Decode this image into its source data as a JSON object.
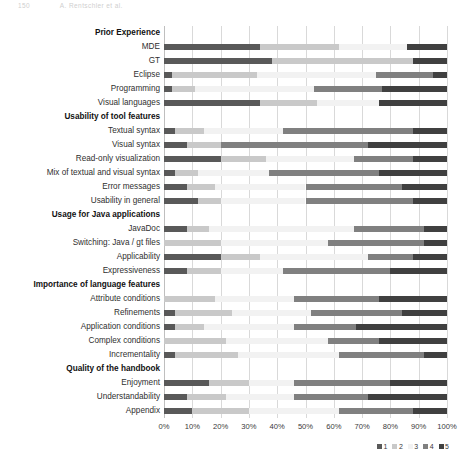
{
  "page_header": {
    "left": "150",
    "right": "A. Rentschler et al."
  },
  "chart_data": {
    "type": "bar",
    "subtype": "stacked-horizontal-100pct",
    "title": "",
    "xlabel": "",
    "ylabel": "",
    "xlim": [
      0,
      100
    ],
    "xticks": [
      "0%",
      "10%",
      "20%",
      "30%",
      "40%",
      "50%",
      "60%",
      "70%",
      "80%",
      "90%",
      "100%"
    ],
    "xtick_values": [
      0,
      10,
      20,
      30,
      40,
      50,
      60,
      70,
      80,
      90,
      100
    ],
    "grid": true,
    "grid_axis": "x",
    "legend": {
      "position": "bottom-right",
      "orientation": "horizontal",
      "entries": [
        {
          "name": "1",
          "color": "#595959"
        },
        {
          "name": "2",
          "color": "#c9c9c9"
        },
        {
          "name": "3",
          "color": "#f2f2f2"
        },
        {
          "name": "4",
          "color": "#808080"
        },
        {
          "name": "5",
          "color": "#404040"
        }
      ]
    },
    "series": [
      {
        "name": "1",
        "color": "#595959"
      },
      {
        "name": "2",
        "color": "#c9c9c9"
      },
      {
        "name": "3",
        "color": "#f2f2f2"
      },
      {
        "name": "4",
        "color": "#808080"
      },
      {
        "name": "5",
        "color": "#404040"
      }
    ],
    "groups": [
      {
        "label": "Prior Experience",
        "categories": [
          {
            "label": "MDE",
            "values": [
              34,
              28,
              24,
              0,
              14
            ]
          },
          {
            "label": "GT",
            "values": [
              38,
              50,
              0,
              0,
              12
            ]
          },
          {
            "label": "Eclipse",
            "values": [
              3,
              30,
              42,
              20,
              5
            ]
          },
          {
            "label": "Programming",
            "values": [
              3,
              8,
              42,
              24,
              23
            ]
          },
          {
            "label": "Visual languages",
            "values": [
              34,
              20,
              22,
              0,
              24
            ]
          }
        ]
      },
      {
        "label": "Usability of tool features",
        "categories": [
          {
            "label": "Textual syntax",
            "values": [
              4,
              10,
              28,
              46,
              12
            ]
          },
          {
            "label": "Visual syntax",
            "values": [
              8,
              12,
              0,
              52,
              28
            ]
          },
          {
            "label": "Read-only visualization",
            "values": [
              20,
              16,
              31,
              21,
              12
            ]
          },
          {
            "label": "Mix of textual and visual syntax",
            "values": [
              4,
              8,
              25,
              39,
              24
            ]
          },
          {
            "label": "Error messages",
            "values": [
              8,
              10,
              32,
              34,
              16
            ]
          },
          {
            "label": "Usability in general",
            "values": [
              12,
              8,
              30,
              38,
              12
            ]
          }
        ]
      },
      {
        "label": "Usage for Java applications",
        "categories": [
          {
            "label": "JavaDoc",
            "values": [
              8,
              8,
              51,
              25,
              8
            ]
          },
          {
            "label": "Switching: Java / gt files",
            "values": [
              0,
              20,
              38,
              34,
              8
            ]
          },
          {
            "label": "Applicability",
            "values": [
              20,
              14,
              38,
              16,
              12
            ]
          },
          {
            "label": "Expressiveness",
            "values": [
              8,
              12,
              22,
              38,
              20
            ]
          }
        ]
      },
      {
        "label": "Importance of language features",
        "categories": [
          {
            "label": "Attribute conditions",
            "values": [
              0,
              18,
              28,
              30,
              24
            ]
          },
          {
            "label": "Refinements",
            "values": [
              4,
              20,
              28,
              32,
              16
            ]
          },
          {
            "label": "Application conditions",
            "values": [
              4,
              10,
              32,
              22,
              32
            ]
          },
          {
            "label": "Complex conditions",
            "values": [
              0,
              22,
              36,
              18,
              24
            ]
          },
          {
            "label": "Incrementality",
            "values": [
              4,
              22,
              36,
              30,
              8
            ]
          }
        ]
      },
      {
        "label": "Quality of the handbook",
        "categories": [
          {
            "label": "Enjoyment",
            "values": [
              16,
              14,
              16,
              34,
              20
            ]
          },
          {
            "label": "Understandability",
            "values": [
              8,
              14,
              24,
              26,
              28
            ]
          },
          {
            "label": "Appendix",
            "values": [
              10,
              20,
              32,
              26,
              12
            ]
          }
        ]
      }
    ]
  }
}
